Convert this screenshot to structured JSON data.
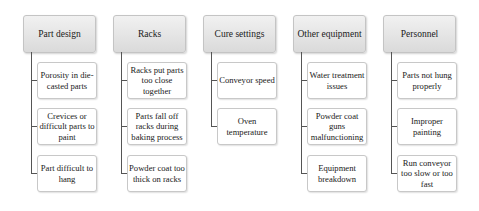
{
  "diagram": {
    "categories": [
      {
        "title": "Part design",
        "items": [
          "Porosity in die-casted parts",
          "Crevices or difficult parts to paint",
          "Part difficult to hang"
        ]
      },
      {
        "title": "Racks",
        "items": [
          "Racks put parts too close together",
          "Parts fall off racks during baking process",
          "Powder coat too thick on racks"
        ]
      },
      {
        "title": "Cure settings",
        "items": [
          "Conveyor speed",
          "Oven temperature"
        ]
      },
      {
        "title": "Other equipment",
        "items": [
          "Water treatment issues",
          "Powder coat guns malfunctioning",
          "Equipment breakdown"
        ]
      },
      {
        "title": "Personnel",
        "items": [
          "Parts not hung properly",
          "Improper painting",
          "Run conveyor too slow or too fast"
        ]
      }
    ]
  }
}
